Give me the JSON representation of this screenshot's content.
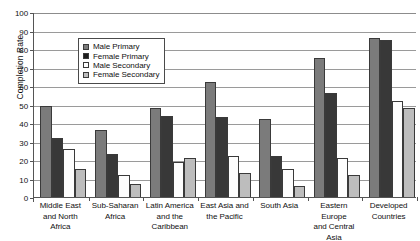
{
  "chart_data": {
    "type": "bar",
    "title": "",
    "xlabel": "",
    "ylabel": "Completion Rate",
    "ylim": [
      0,
      100
    ],
    "y_ticks": [
      0,
      10,
      20,
      30,
      40,
      50,
      60,
      70,
      80,
      90,
      100
    ],
    "grid": true,
    "legend_position": "upper-left-inside",
    "categories": [
      "Middle East and North Africa",
      "Sub-Saharan Africa",
      "Latin America and the Caribbean",
      "East Asia and the Pacific",
      "South Asia",
      "Eastern Europe and Central Asia",
      "Developed Countries"
    ],
    "category_lines": [
      [
        "Middle East",
        "and North",
        "Africa"
      ],
      [
        "Sub-Saharan",
        "Africa"
      ],
      [
        "Latin America",
        "and the",
        "Caribbean"
      ],
      [
        "East Asia and",
        "the Pacific"
      ],
      [
        "South Asia"
      ],
      [
        "Eastern Europe",
        "and Central",
        "Asia"
      ],
      [
        "Developed",
        "Countries"
      ]
    ],
    "series": [
      {
        "name": "Male Primary",
        "color": "#7b7b7b",
        "values": [
          49,
          36,
          48,
          62,
          42,
          75,
          86
        ]
      },
      {
        "name": "Female Primary",
        "color": "#383838",
        "values": [
          32,
          23,
          44,
          43,
          22,
          56,
          85
        ]
      },
      {
        "name": "Male Secondary",
        "color": "#ffffff",
        "values": [
          26,
          12,
          19,
          22,
          15,
          21,
          52
        ]
      },
      {
        "name": "Female Secondary",
        "color": "#bdbdbd",
        "values": [
          15,
          7,
          21,
          13,
          6,
          12,
          48
        ]
      }
    ]
  },
  "legend": {
    "items": [
      {
        "label": "Male Primary"
      },
      {
        "label": "Female Primary"
      },
      {
        "label": "Male Secondary"
      },
      {
        "label": "Female Secondary"
      }
    ]
  },
  "axis": {
    "y_title": "Completion Rate"
  }
}
